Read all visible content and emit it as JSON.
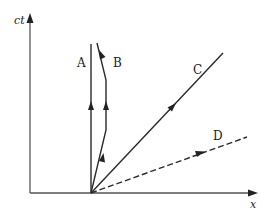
{
  "diagram": {
    "type": "spacetime-diagram",
    "axes": {
      "vertical_label": "ct",
      "horizontal_label": "x"
    },
    "worldlines": [
      {
        "id": "A",
        "label": "A",
        "style": "solid",
        "description": "vertical worldline at rest"
      },
      {
        "id": "B",
        "label": "B",
        "style": "solid",
        "description": "moves right, stops, then moves left"
      },
      {
        "id": "C",
        "label": "C",
        "style": "solid",
        "description": "light-like diagonal worldline"
      },
      {
        "id": "D",
        "label": "D",
        "style": "dashed",
        "description": "shallow dashed line (spacelike)"
      }
    ],
    "colors": {
      "line": "#2a2a2a",
      "axis": "#555555",
      "background": "#ffffff"
    }
  }
}
